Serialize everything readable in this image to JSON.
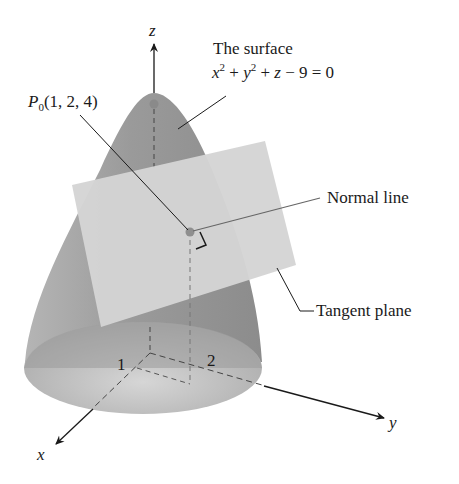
{
  "figure": {
    "surface_label_line1": "The surface",
    "surface_equation": {
      "x": "x",
      "x_exp": "2",
      "plus1": " + ",
      "y": "y",
      "y_exp": "2",
      "plus2": " + ",
      "z": "z",
      "rest": " − 9 = 0"
    },
    "point_label": {
      "P": "P",
      "sub": "0",
      "coords": "(1, 2, 4)"
    },
    "normal_line_label": "Normal line",
    "tangent_plane_label": "Tangent plane",
    "axes": {
      "x": "x",
      "y": "y",
      "z": "z"
    },
    "ticks": {
      "x_tick": "1",
      "y_tick": "2"
    },
    "colors": {
      "surface_dark": "#8f8f8f",
      "surface_mid": "#a6a6a6",
      "base_fill": "#b8b8b8",
      "plane": "#d4d4d4",
      "point": "#909090",
      "line": "#2a2a2a"
    }
  }
}
